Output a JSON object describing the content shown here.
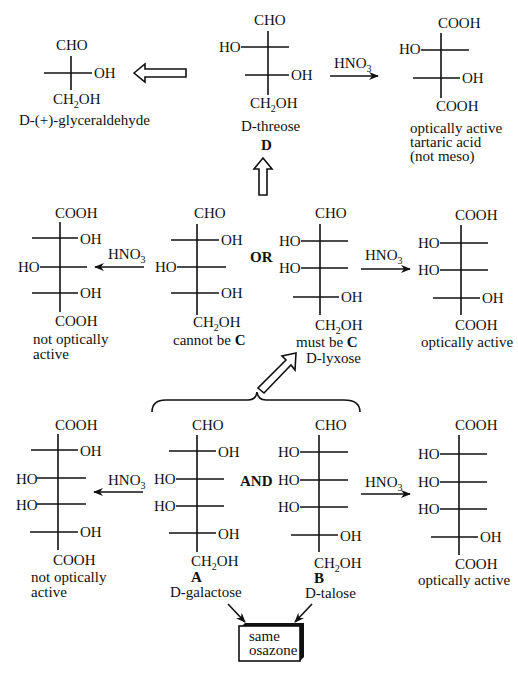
{
  "colors": {
    "ink": "#111111",
    "background": "#ffffff"
  },
  "glyceraldehyde": {
    "top": "CHO",
    "r1": "OH",
    "bottom_main": "CH",
    "bottom_sub": "2",
    "bottom_end": "OH",
    "name": "D-(+)-glyceraldehyde"
  },
  "threose": {
    "top": "CHO",
    "l1": "HO",
    "r2": "OH",
    "bottom_main": "CH",
    "bottom_sub": "2",
    "bottom_end": "OH",
    "name": "D-threose",
    "letter": "D"
  },
  "tartaric": {
    "top": "COOH",
    "l1": "HO",
    "r2": "OH",
    "bottom": "COOH",
    "caption": [
      "optically active",
      "tartaric acid",
      "(not meso)"
    ]
  },
  "reagent": {
    "main": "HNO",
    "sub": "3"
  },
  "row2": {
    "left_acid": {
      "top": "COOH",
      "r1": "OH",
      "l2": "HO",
      "r3": "OH",
      "bottom": "COOH",
      "caption": [
        "not optically",
        "active"
      ]
    },
    "sugar_c1": {
      "top": "CHO",
      "r1": "OH",
      "l2": "HO",
      "r3": "OH",
      "caption_pre": "cannot be ",
      "caption_bold": "C"
    },
    "or_label": "OR",
    "sugar_c2": {
      "top": "CHO",
      "l1": "HO",
      "l2": "HO",
      "r3": "OH",
      "caption_pre": "must be ",
      "caption_bold": "C",
      "name": "D-lyxose"
    },
    "right_acid": {
      "top": "COOH",
      "l1": "HO",
      "l2": "HO",
      "r3": "OH",
      "bottom": "COOH",
      "caption": "optically active"
    }
  },
  "row3": {
    "left_acid": {
      "top": "COOH",
      "r1": "OH",
      "l2": "HO",
      "l3": "HO",
      "r4": "OH",
      "bottom": "COOH",
      "caption": [
        "not optically",
        "active"
      ]
    },
    "sugar_a": {
      "top": "CHO",
      "r1": "OH",
      "l2": "HO",
      "l3": "HO",
      "r4": "OH",
      "letter": "A",
      "name": "D-galactose"
    },
    "and_label": "AND",
    "sugar_b": {
      "top": "CHO",
      "l1": "HO",
      "l2": "HO",
      "l3": "HO",
      "r4": "OH",
      "letter": "B",
      "name": "D-talose"
    },
    "right_acid": {
      "top": "COOH",
      "l1": "HO",
      "l2": "HO",
      "l3": "HO",
      "r4": "OH",
      "bottom": "COOH",
      "caption": "optically active"
    }
  },
  "osazone_box": [
    "same",
    "osazone"
  ]
}
